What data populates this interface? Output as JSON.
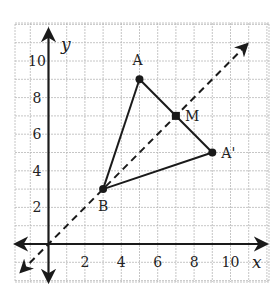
{
  "figure": {
    "type": "coordinate-plane",
    "axes": {
      "x_label": "x",
      "y_label": "y",
      "x_ticks": [
        "2",
        "4",
        "6",
        "8",
        "10"
      ],
      "y_ticks": [
        "2",
        "4",
        "6",
        "8",
        "10"
      ],
      "grid": true,
      "grid_range": {
        "x": [
          -2,
          12
        ],
        "y": [
          -2,
          12
        ]
      }
    },
    "points": [
      {
        "label": "A",
        "x": 5,
        "y": 9
      },
      {
        "label": "B",
        "x": 3,
        "y": 3
      },
      {
        "label": "A'",
        "x": 9,
        "y": 5
      },
      {
        "label": "M",
        "x": 7,
        "y": 7,
        "marker": "square"
      }
    ],
    "segments": [
      {
        "from": "A",
        "to": "B"
      },
      {
        "from": "B",
        "to": "A'"
      },
      {
        "from": "A",
        "to": "A'"
      }
    ],
    "dashed_line": {
      "description": "line y = x through B and M",
      "from": [
        -1.5,
        -1.5
      ],
      "to": [
        10.9,
        10.9
      ],
      "arrows": "both"
    },
    "colors": {
      "grid": "#b8b8b8",
      "ink": "#1a1a1a",
      "background": "#ffffff"
    }
  }
}
